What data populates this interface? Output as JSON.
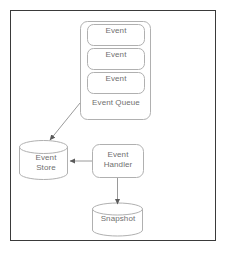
{
  "diagram": {
    "stroke_color": "#b0b0b0",
    "text_color": "#6f6f6f",
    "frame_color": "#3a3a3a",
    "background": "#ffffff",
    "nodes": [
      {
        "id": "event-1",
        "label": "Event",
        "shape": "rounded-rect"
      },
      {
        "id": "event-2",
        "label": "Event",
        "shape": "rounded-rect"
      },
      {
        "id": "event-3",
        "label": "Event",
        "shape": "rounded-rect"
      },
      {
        "id": "event-queue",
        "label": "Event Queue",
        "shape": "rounded-rect-container"
      },
      {
        "id": "event-store",
        "label": "Event\nStore",
        "shape": "cylinder"
      },
      {
        "id": "event-handler",
        "label": "Event\nHandler",
        "shape": "rounded-rect"
      },
      {
        "id": "snapshot",
        "label": "Snapshot",
        "shape": "cylinder"
      }
    ],
    "edges": [
      {
        "id": "queue-to-store",
        "from": "event-queue",
        "to": "event-store",
        "style": "arrow"
      },
      {
        "id": "handler-to-store",
        "from": "event-handler",
        "to": "event-store",
        "style": "arrow"
      },
      {
        "id": "handler-to-snapshot",
        "from": "event-handler",
        "to": "snapshot",
        "style": "arrow"
      }
    ]
  }
}
